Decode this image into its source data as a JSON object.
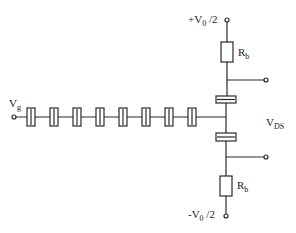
{
  "diagram": {
    "type": "circuit-schematic",
    "colors": {
      "line": "#2a2a2a",
      "background": "#ffffff"
    },
    "labels": {
      "vg": {
        "main": "V",
        "sub": "g"
      },
      "vplus": {
        "prefix": "+V",
        "sub": "0",
        "suffix": " /2"
      },
      "vminus": {
        "prefix": "-V",
        "sub": "0",
        "suffix": " /2"
      },
      "rb_top": {
        "main": "R",
        "sub": "b"
      },
      "rb_bottom": {
        "main": "R",
        "sub": "b"
      },
      "vds": {
        "main": "V",
        "sub": "DS"
      }
    },
    "capacitor_chain": {
      "count": 8,
      "centers_x": [
        31,
        54,
        77,
        100,
        123,
        146,
        169,
        192
      ],
      "y": 117
    },
    "nodes": {
      "input_terminal": [
        14,
        117
      ],
      "top_terminal": [
        227,
        20
      ],
      "bottom_terminal": [
        226,
        216
      ],
      "upper_output_terminal": [
        266,
        80
      ],
      "lower_output_terminal": [
        266,
        157
      ]
    }
  }
}
